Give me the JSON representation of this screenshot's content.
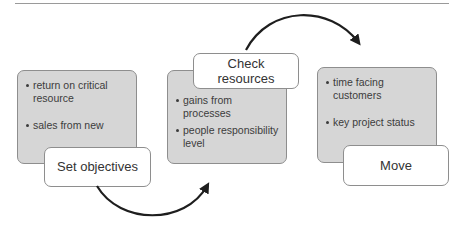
{
  "diagram": {
    "type": "process-flow",
    "steps": [
      {
        "label": "Set objectives",
        "bullets": [
          "return on critical resource",
          "sales from new"
        ]
      },
      {
        "label": "Check resources",
        "label_lines": [
          "Check",
          "resources"
        ],
        "bullets": [
          "gains from processes",
          "people responsibility level"
        ]
      },
      {
        "label": "Move",
        "bullets": [
          "time facing customers",
          "key project status"
        ]
      }
    ],
    "connectors": [
      {
        "from": "Set objectives",
        "to": "Check resources",
        "style": "curved-arrow-below"
      },
      {
        "from": "Check resources",
        "to": "Move",
        "style": "curved-arrow-above"
      }
    ],
    "colors": {
      "box_fill": "#d6d6d6",
      "label_fill": "#ffffff",
      "border": "#8e8e8e",
      "arrow": "#1e1e1e",
      "text": "#333333"
    }
  }
}
